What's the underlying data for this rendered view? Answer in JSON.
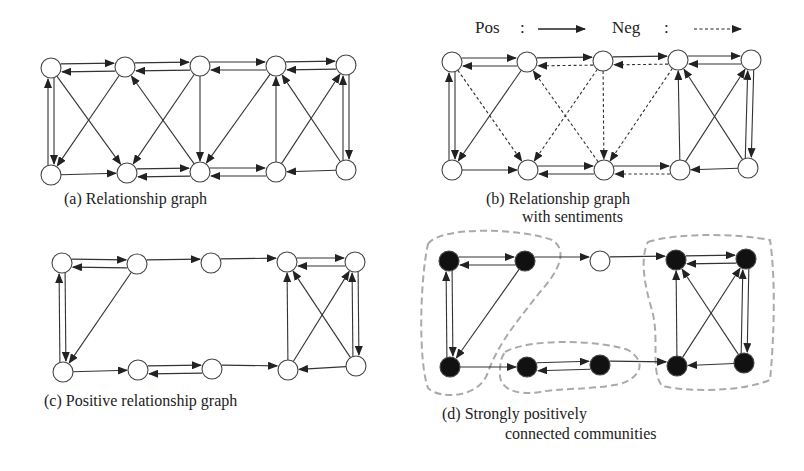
{
  "figure": {
    "legend": {
      "pos_label": "Pos",
      "neg_label": "Neg",
      "separator": ":"
    },
    "colors": {
      "edge": "#333333",
      "node_stroke": "#444444",
      "node_fill_open": "#ffffff",
      "node_fill_filled": "#111111",
      "community_outline": "#aaaaaa"
    },
    "panels": [
      {
        "id": "a",
        "caption_line1": "(a) Relationship graph",
        "caption_line2": "",
        "nodes": {
          "T0": [
            51,
            68
          ],
          "T1": [
            125,
            67
          ],
          "T2": [
            200,
            66
          ],
          "T3": [
            276,
            66
          ],
          "T4": [
            346,
            65
          ],
          "B0": [
            51,
            175
          ],
          "B1": [
            127,
            173
          ],
          "B2": [
            200,
            172
          ],
          "B3": [
            276,
            172
          ],
          "B4": [
            346,
            170
          ]
        },
        "filled": [],
        "show_neg": true,
        "neg_dashed": false
      },
      {
        "id": "b",
        "caption_line1": "(b) Relationship graph",
        "caption_line2": "with sentiments",
        "nodes": {
          "T0": [
            452,
            62
          ],
          "T1": [
            527,
            62
          ],
          "T2": [
            603,
            61
          ],
          "T3": [
            678,
            60
          ],
          "T4": [
            751,
            60
          ],
          "B0": [
            452,
            170
          ],
          "B1": [
            528,
            170
          ],
          "B2": [
            604,
            170
          ],
          "B3": [
            680,
            170
          ],
          "B4": [
            748,
            168
          ]
        },
        "filled": [],
        "show_neg": true,
        "neg_dashed": true
      },
      {
        "id": "c",
        "caption_line1": "(c) Positive relationship graph",
        "caption_line2": "",
        "nodes": {
          "T0": [
            62,
            263
          ],
          "T1": [
            137,
            264
          ],
          "T2": [
            211,
            263
          ],
          "T3": [
            287,
            262
          ],
          "T4": [
            355,
            262
          ],
          "B0": [
            63,
            372
          ],
          "B1": [
            138,
            370
          ],
          "B2": [
            212,
            369
          ],
          "B3": [
            288,
            370
          ],
          "B4": [
            356,
            366
          ]
        },
        "filled": [],
        "show_neg": false,
        "neg_dashed": false
      },
      {
        "id": "d",
        "caption_line1": "(d) Strongly positively",
        "caption_line2": "connected communities",
        "nodes": {
          "T0": [
            449,
            261
          ],
          "T1": [
            525,
            261
          ],
          "T2": [
            600,
            261
          ],
          "T3": [
            676,
            260
          ],
          "T4": [
            746,
            259
          ],
          "B0": [
            450,
            367
          ],
          "B1": [
            527,
            367
          ],
          "B2": [
            600,
            365
          ],
          "B3": [
            677,
            366
          ],
          "B4": [
            744,
            363
          ]
        },
        "filled": [
          "T0",
          "T1",
          "B0",
          "B1",
          "B2",
          "T3",
          "T4",
          "B3",
          "B4"
        ],
        "show_neg": false,
        "neg_dashed": false,
        "communities": [
          "M 428 244 C 440 226, 520 228, 552 240 C 568 250, 560 270, 540 292 C 520 318, 500 340, 488 372 C 480 398, 440 400, 428 388 C 418 360, 420 280, 428 244 Z",
          "M 505 352 C 530 338, 600 340, 628 350 C 648 362, 640 378, 620 384 C 590 390, 560 388, 540 392 C 515 396, 498 388, 500 372 C 500 362, 502 356, 505 352 Z",
          "M 648 242 C 680 232, 740 234, 770 240 C 776 280, 774 340, 770 380 C 740 392, 690 392, 662 386 C 650 370, 660 340, 652 310 C 644 284, 640 258, 648 242 Z"
        ]
      }
    ],
    "edges": [
      {
        "from": "T0",
        "to": "T1",
        "sign": "pos",
        "offset": -4
      },
      {
        "from": "T1",
        "to": "T0",
        "sign": "pos",
        "offset": -4
      },
      {
        "from": "T1",
        "to": "T2",
        "sign": "pos",
        "offset": -4
      },
      {
        "from": "T2",
        "to": "T1",
        "sign": "neg",
        "offset": -4
      },
      {
        "from": "T2",
        "to": "T3",
        "sign": "pos",
        "offset": -4
      },
      {
        "from": "T3",
        "to": "T2",
        "sign": "neg",
        "offset": -4
      },
      {
        "from": "T3",
        "to": "T4",
        "sign": "pos",
        "offset": -4
      },
      {
        "from": "T4",
        "to": "T3",
        "sign": "pos",
        "offset": -4
      },
      {
        "from": "T0",
        "to": "B0",
        "sign": "pos",
        "offset": -3
      },
      {
        "from": "B0",
        "to": "T0",
        "sign": "pos",
        "offset": -3
      },
      {
        "from": "T0",
        "to": "B1",
        "sign": "neg",
        "offset": 0
      },
      {
        "from": "T1",
        "to": "B0",
        "sign": "pos",
        "offset": 0
      },
      {
        "from": "B2",
        "to": "T1",
        "sign": "neg",
        "offset": 0
      },
      {
        "from": "T2",
        "to": "B1",
        "sign": "neg",
        "offset": 0
      },
      {
        "from": "T2",
        "to": "B2",
        "sign": "neg",
        "offset": 0
      },
      {
        "from": "T3",
        "to": "B2",
        "sign": "neg",
        "offset": 0
      },
      {
        "from": "B3",
        "to": "T3",
        "sign": "pos",
        "offset": 0
      },
      {
        "from": "B3",
        "to": "T4",
        "sign": "pos",
        "offset": 0
      },
      {
        "from": "B4",
        "to": "T3",
        "sign": "pos",
        "offset": 0
      },
      {
        "from": "T4",
        "to": "B4",
        "sign": "pos",
        "offset": -3
      },
      {
        "from": "B4",
        "to": "T4",
        "sign": "pos",
        "offset": -3
      },
      {
        "from": "B0",
        "to": "B1",
        "sign": "pos",
        "offset": 0
      },
      {
        "from": "B1",
        "to": "B2",
        "sign": "pos",
        "offset": -4
      },
      {
        "from": "B2",
        "to": "B1",
        "sign": "pos",
        "offset": -4
      },
      {
        "from": "B2",
        "to": "B3",
        "sign": "pos",
        "offset": -4
      },
      {
        "from": "B3",
        "to": "B2",
        "sign": "neg",
        "offset": -4
      },
      {
        "from": "B4",
        "to": "B3",
        "sign": "pos",
        "offset": 0
      }
    ]
  }
}
